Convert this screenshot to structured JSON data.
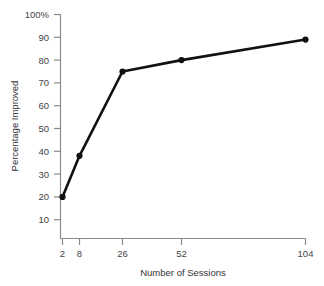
{
  "chart_data": {
    "type": "line",
    "title": "",
    "subtitle": "",
    "xlabel": "Number of Sessions",
    "ylabel": "Percentage Improved",
    "x": [
      2,
      8,
      26,
      52,
      104
    ],
    "values": [
      20,
      38,
      75,
      80,
      89
    ],
    "categories": [
      "2",
      "8",
      "26",
      "52",
      "104"
    ],
    "xticks": [
      "2",
      "8",
      "26",
      "52",
      "104"
    ],
    "yticks": [
      "10",
      "20",
      "30",
      "40",
      "50",
      "60",
      "70",
      "80",
      "90",
      "100%"
    ],
    "ylim": [
      0,
      100
    ],
    "grid": false,
    "legend": false,
    "legend_position": "none",
    "series": [
      {
        "name": "Percentage Improved",
        "values": [
          20,
          38,
          75,
          80,
          89
        ],
        "color": "#111111",
        "marker": "circle"
      }
    ]
  },
  "axes": {
    "y_title": "Percentage Improved",
    "x_title": "Number of Sessions",
    "y_tick_labels": [
      {
        "text": "100%",
        "value": 100
      },
      {
        "text": "90",
        "value": 90
      },
      {
        "text": "80",
        "value": 80
      },
      {
        "text": "70",
        "value": 70
      },
      {
        "text": "60",
        "value": 60
      },
      {
        "text": "50",
        "value": 50
      },
      {
        "text": "40",
        "value": 40
      },
      {
        "text": "30",
        "value": 30
      },
      {
        "text": "20",
        "value": 20
      },
      {
        "text": "10",
        "value": 10
      }
    ],
    "x_tick_labels": [
      {
        "text": "2",
        "value": 2
      },
      {
        "text": "8",
        "value": 8
      },
      {
        "text": "26",
        "value": 26
      },
      {
        "text": "52",
        "value": 52
      },
      {
        "text": "104",
        "value": 104
      }
    ]
  },
  "style": {
    "background": "#ffffff",
    "axis_color": "#8a8a8a",
    "tick_label_color": "#444444",
    "title_color": "#333333",
    "line_color": "#111111",
    "marker_color": "#111111"
  }
}
